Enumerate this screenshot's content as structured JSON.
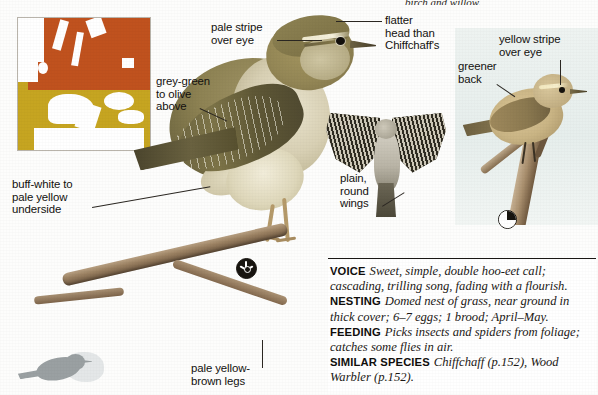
{
  "page": {
    "top_caption_fragment": "birch and willow.",
    "background_color": "#fdfdfc"
  },
  "map": {
    "name": "distribution-map",
    "legend": {
      "breeding_color": "#c0521e",
      "wintering_color": "#c6a521"
    }
  },
  "annotations": [
    {
      "id": "pale-stripe-over-eye",
      "text": "pale stripe\nover eye"
    },
    {
      "id": "flatter-head",
      "text": "flatter\nhead than\nChiffchaff's"
    },
    {
      "id": "yellow-stripe-over-eye",
      "text": "yellow stripe\nover eye"
    },
    {
      "id": "greener-back",
      "text": "greener\nback"
    },
    {
      "id": "grey-green-to-olive-above",
      "text": "grey-green\nto olive\nabove"
    },
    {
      "id": "buff-white-underside",
      "text": "buff-white to\npale yellow\nunderside"
    },
    {
      "id": "plain-round-wings",
      "text": "plain,\nround\nwings"
    },
    {
      "id": "pale-yellow-brown-legs",
      "text": "pale yellow-\nbrown legs"
    }
  ],
  "infobox": {
    "rows": [
      {
        "heading": "VOICE",
        "body": "Sweet, simple, double hoo-eet call; cascading, trilling song, fading with a flourish."
      },
      {
        "heading": "NESTING",
        "body": "Domed nest of grass, near ground in thick cover; 6–7 eggs; 1 brood; April–May."
      },
      {
        "heading": "FEEDING",
        "body": "Picks insects and spiders from foliage; catches some flies in air."
      },
      {
        "heading": "SIMILAR SPECIES",
        "body": "Chiffchaff (p.152), Wood Warbler (p.152)."
      }
    ]
  },
  "badges": [
    {
      "id": "badge-main",
      "kind": "sun-disc-icon"
    },
    {
      "id": "badge-inset",
      "kind": "quarter-pie-icon"
    }
  ]
}
